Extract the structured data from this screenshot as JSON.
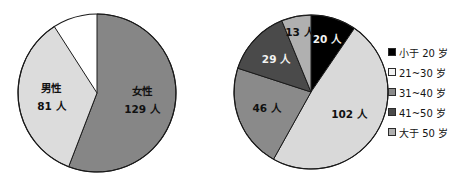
{
  "figure": {
    "background": "#ffffff"
  },
  "chart_data": [
    {
      "type": "pie",
      "name": "gender-distribution",
      "title": "",
      "total": 210,
      "unit": "人",
      "start_angle_deg": 0,
      "direction": "clockwise",
      "categories": [
        "女性",
        "男性"
      ],
      "values": [
        129,
        102
      ],
      "slices": [
        {
          "label_line1": "女性",
          "label_line2": "129 人",
          "value": 129,
          "percent": 61.4,
          "color": "#868686",
          "label_on_dark": false
        },
        {
          "label_line1": "男性",
          "label_line2": "81 人",
          "value": 81,
          "percent": 38.6,
          "color": "#dcdcdc",
          "label_on_dark": false
        }
      ],
      "legend": null,
      "grid": false
    },
    {
      "type": "pie",
      "name": "age-distribution",
      "title": "",
      "total": 210,
      "unit": "人",
      "start_angle_deg": 0,
      "direction": "clockwise",
      "categories": [
        "小于 20 岁",
        "21~30 岁",
        "31~40 岁",
        "41~50 岁",
        "大于 50 岁"
      ],
      "values": [
        20,
        102,
        46,
        29,
        13
      ],
      "slices": [
        {
          "label": "20 人",
          "value": 20,
          "percent": 9.5,
          "color": "#000000",
          "label_on_dark": true
        },
        {
          "label": "102 人",
          "value": 102,
          "percent": 48.6,
          "color": "#d9d9d9",
          "label_on_dark": false
        },
        {
          "label": "46 人",
          "value": 46,
          "percent": 21.9,
          "color": "#8a8a8a",
          "label_on_dark": false
        },
        {
          "label": "29 人",
          "value": 29,
          "percent": 13.8,
          "color": "#4a4a4a",
          "label_on_dark": true
        },
        {
          "label": "13 人",
          "value": 13,
          "percent": 6.2,
          "color": "#b0b0b0",
          "label_on_dark": false
        }
      ],
      "legend": {
        "position": "right",
        "entries": [
          {
            "label": "小于 20 岁",
            "color": "#000000"
          },
          {
            "label": "21~30 岁",
            "color": "#f2f2f2"
          },
          {
            "label": "31~40 岁",
            "color": "#8a8a8a"
          },
          {
            "label": "41~50 岁",
            "color": "#4a4a4a"
          },
          {
            "label": "大于 50 岁",
            "color": "#b0b0b0"
          }
        ]
      },
      "grid": false
    }
  ]
}
